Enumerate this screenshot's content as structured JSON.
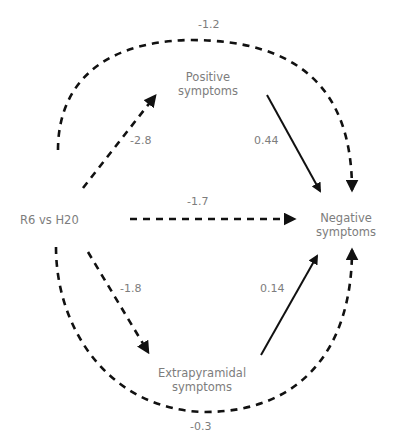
{
  "diagram": {
    "type": "mediation-path-diagram",
    "nodes": {
      "exposure": {
        "label": "R6 vs H20"
      },
      "positive": {
        "line1": "Positive",
        "line2": "symptoms"
      },
      "negative": {
        "line1": "Negative",
        "line2": "symptoms"
      },
      "extrapyramidal": {
        "line1": "Extrapyramidal",
        "line2": "symptoms"
      }
    },
    "edges": [
      {
        "from": "R6 vs H20",
        "to": "Positive symptoms",
        "coef": "-2.8",
        "style": "dashed"
      },
      {
        "from": "R6 vs H20",
        "to": "Negative symptoms",
        "coef": "-1.7",
        "style": "dashed"
      },
      {
        "from": "R6 vs H20",
        "to": "Extrapyramidal symptoms",
        "coef": "-1.8",
        "style": "dashed"
      },
      {
        "from": "Positive symptoms",
        "to": "Negative symptoms",
        "coef": "0.44",
        "style": "solid"
      },
      {
        "from": "Extrapyramidal symptoms",
        "to": "Negative symptoms",
        "coef": "0.14",
        "style": "solid"
      },
      {
        "from": "R6 vs H20",
        "to": "Negative symptoms",
        "via": "top arc",
        "coef": "-1.2",
        "style": "dashed"
      },
      {
        "from": "R6 vs H20",
        "to": "Negative symptoms",
        "via": "bottom arc",
        "coef": "-0.3",
        "style": "dashed"
      }
    ],
    "colors": {
      "line": "#111111",
      "text": "#7d7d7d"
    }
  }
}
